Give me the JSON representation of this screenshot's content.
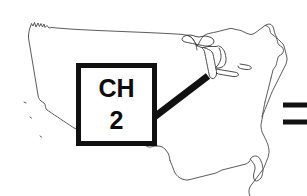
{
  "figure": {
    "background_color": "#ffffff",
    "line_color": "#4a4a4a",
    "accent_color": "#111111",
    "width": 307,
    "height": 196
  },
  "callout": {
    "line_1": "CH",
    "line_2": "2",
    "full_label": "CH 2",
    "box_color": "#111111",
    "fill_color": "#ffffff",
    "points_to": "Chicago / Lake Michigan"
  },
  "map": {
    "region_name": "Continental United States",
    "features": [
      "coastline-outline",
      "great-lakes",
      "florida-peninsula",
      "texas-gulf-coast",
      "northeast-coastline"
    ]
  },
  "leader": {
    "from_x": 155,
    "from_y": 116,
    "to_x": 208,
    "to_y": 76
  },
  "edge_bars": [
    {
      "y": 105,
      "x_start": 283,
      "x_end": 307
    },
    {
      "y": 122,
      "x_start": 283,
      "x_end": 307
    }
  ]
}
